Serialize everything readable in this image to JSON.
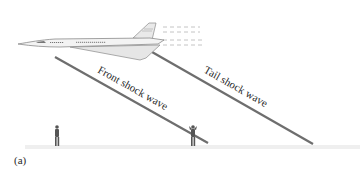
{
  "figure": {
    "panel_label": "(a)",
    "labels": {
      "front_shock": "Front shock wave",
      "tail_shock": "Tail shock wave"
    },
    "elements": {
      "aircraft": "supersonic-jet",
      "observers": [
        "observer-left",
        "observer-right"
      ],
      "ground": "ground-line"
    },
    "colors": {
      "shock_line": "#6e6e6e",
      "aircraft_body": "#f2f2f2",
      "aircraft_outline": "#8a8a8a",
      "figure": "#555555",
      "ground": "#eeeeee",
      "text": "#2a2a2a"
    }
  }
}
